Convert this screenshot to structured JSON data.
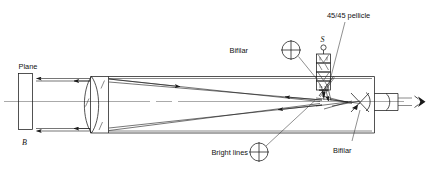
{
  "figure": {
    "background_color": "#ffffff",
    "line_color": "#1a1a1a"
  },
  "labels": {
    "plane": "Plane",
    "mirror_letter": "B",
    "source_letter": "S",
    "pellicle": "45/45 pellicle",
    "bifilar_top": "Bifilar",
    "bifilar_bottom": "Bifilar",
    "bright_lines": "Bright lines"
  },
  "icons": {
    "crosshair_bifilar_top": "crosshair-circle-icon",
    "crosshair_bifilar_bottom": "crosshair-circle-icon",
    "crosshair_bright_lines": "crosshair-circle-icon",
    "eye": "eye-icon",
    "lamp": "lamp-icon",
    "arrowhead": "arrowhead-icon"
  },
  "components": [
    {
      "name": "plane-mirror",
      "label": "Plane",
      "sublabel": "B"
    },
    {
      "name": "objective-lens",
      "label": ""
    },
    {
      "name": "telescope-tube",
      "label": ""
    },
    {
      "name": "light-source",
      "label": "S"
    },
    {
      "name": "pellicle-beamsplitter",
      "label": "45/45 pellicle"
    },
    {
      "name": "bifilar-reticle-upper",
      "label": "Bifilar"
    },
    {
      "name": "bifilar-reticle-lower",
      "label": "Bifilar"
    },
    {
      "name": "bright-lines-target",
      "label": "Bright lines"
    },
    {
      "name": "eyepiece",
      "label": ""
    },
    {
      "name": "observer-eye",
      "label": ""
    }
  ]
}
